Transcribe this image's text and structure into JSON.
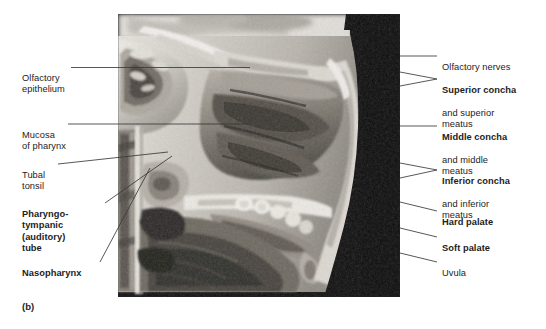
{
  "figure": {
    "caption": "(b)",
    "image": {
      "name": "sagittal-section-nasal-cavity-photograph",
      "description": "Grayscale cadaver sagittal section photograph of the nasal cavity, pharynx and palate",
      "background_color": "#0a0a0a"
    }
  },
  "labels_left": [
    {
      "id": "olfactory-epithelium",
      "bold_text": "",
      "plain_text": "Olfactory\nepithelium",
      "bold": false
    },
    {
      "id": "mucosa-of-pharynx",
      "bold_text": "",
      "plain_text": "Mucosa\nof pharynx",
      "bold": false
    },
    {
      "id": "tubal-tonsil",
      "bold_text": "",
      "plain_text": "Tubal\ntonsil",
      "bold": false
    },
    {
      "id": "pharyngotympanic-auditory-tube",
      "bold_text": "Pharyngo-\ntympanic\n(auditory)\ntube",
      "plain_text": "",
      "bold": true
    },
    {
      "id": "nasopharynx",
      "bold_text": "Nasopharynx",
      "plain_text": "",
      "bold": true
    }
  ],
  "labels_right": [
    {
      "id": "olfactory-nerves",
      "bold_text": "",
      "plain_text": "Olfactory nerves",
      "bold": false
    },
    {
      "id": "superior-concha",
      "bold_text": "Superior concha",
      "plain_text": "and superior\nmeatus",
      "bold": true
    },
    {
      "id": "middle-concha",
      "bold_text": "Middle concha",
      "plain_text": "and middle\nmeatus",
      "bold": true
    },
    {
      "id": "inferior-concha",
      "bold_text": "Inferior concha",
      "plain_text": "and inferior\nmeatus",
      "bold": true
    },
    {
      "id": "hard-palate",
      "bold_text": "Hard palate",
      "plain_text": "",
      "bold": true
    },
    {
      "id": "soft-palate",
      "bold_text": "Soft palate",
      "plain_text": "",
      "bold": true
    },
    {
      "id": "uvula",
      "bold_text": "",
      "plain_text": "Uvula",
      "bold": false
    }
  ],
  "colors": {
    "leader_line": "#3a3a3a",
    "text": "#1d1d1d",
    "page_background": "#ffffff"
  }
}
